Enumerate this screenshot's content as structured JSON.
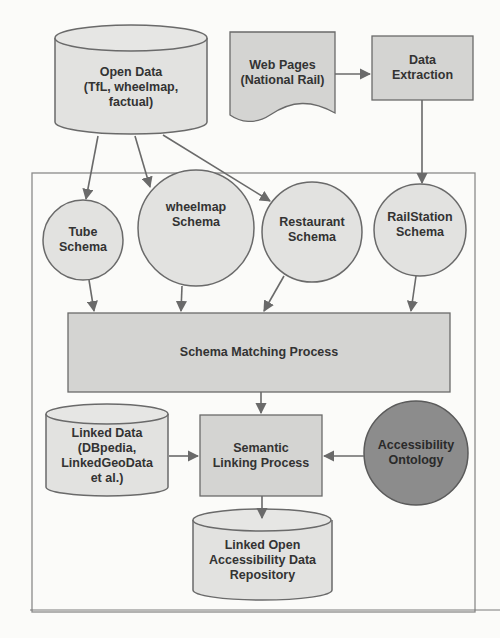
{
  "diagram": {
    "nodes": {
      "open_data": {
        "label": "Open Data\n(TfL, wheelmap,\nfactual)",
        "lines": [
          "Open Data",
          "(TfL, wheelmap,",
          "factual)"
        ],
        "shape": "cylinder"
      },
      "web_pages": {
        "lines": [
          "Web Pages",
          "(National Rail)"
        ],
        "shape": "document"
      },
      "data_extraction": {
        "lines": [
          "Data",
          "Extraction"
        ],
        "shape": "process"
      },
      "tube_schema": {
        "lines": [
          "Tube",
          "Schema"
        ],
        "shape": "circle"
      },
      "wheelmap_schema": {
        "lines": [
          "wheelmap",
          "Schema"
        ],
        "shape": "circle"
      },
      "restaurant_schema": {
        "lines": [
          "Restaurant",
          "Schema"
        ],
        "shape": "circle"
      },
      "railstation_schema": {
        "lines": [
          "RailStation",
          "Schema"
        ],
        "shape": "circle"
      },
      "schema_matching": {
        "lines": [
          "Schema Matching Process"
        ],
        "shape": "process"
      },
      "linked_data": {
        "lines": [
          "Linked Data",
          "(DBpedia,",
          "LinkedGeoData",
          "et al.)"
        ],
        "shape": "cylinder"
      },
      "semantic_linking": {
        "lines": [
          "Semantic",
          "Linking Process"
        ],
        "shape": "process"
      },
      "accessibility_ontology": {
        "lines": [
          "Accessibility",
          "Ontology"
        ],
        "shape": "circle"
      },
      "lod_repository": {
        "lines": [
          "Linked Open",
          "Accessibility Data",
          "Repository"
        ],
        "shape": "cylinder"
      }
    },
    "edges": [
      [
        "open_data",
        "tube_schema"
      ],
      [
        "open_data",
        "wheelmap_schema"
      ],
      [
        "open_data",
        "restaurant_schema"
      ],
      [
        "web_pages",
        "data_extraction"
      ],
      [
        "data_extraction",
        "railstation_schema"
      ],
      [
        "tube_schema",
        "schema_matching"
      ],
      [
        "wheelmap_schema",
        "schema_matching"
      ],
      [
        "restaurant_schema",
        "schema_matching"
      ],
      [
        "railstation_schema",
        "schema_matching"
      ],
      [
        "schema_matching",
        "semantic_linking"
      ],
      [
        "linked_data",
        "semantic_linking"
      ],
      [
        "accessibility_ontology",
        "semantic_linking"
      ],
      [
        "semantic_linking",
        "lod_repository"
      ]
    ],
    "colors": {
      "fill_light": "#e2e2e0",
      "fill_process": "#d4d4d2",
      "fill_ontology": "#8c8c8c",
      "stroke": "#6a6a6a",
      "text": "#333333"
    }
  }
}
